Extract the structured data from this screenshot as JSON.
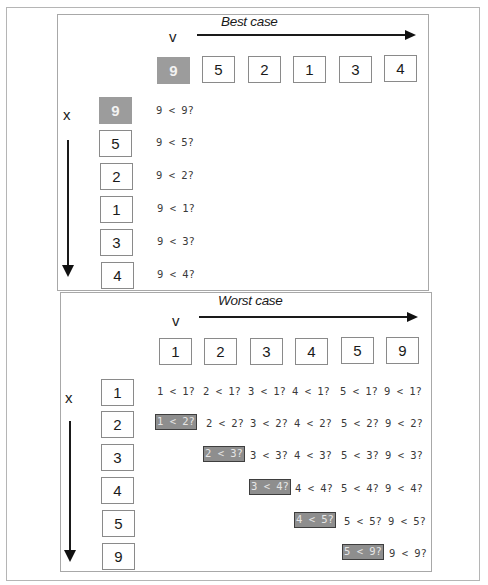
{
  "best_case": {
    "title": "Best case",
    "v_label": "v",
    "x_label": "x",
    "columns": [
      "9",
      "5",
      "2",
      "1",
      "3",
      "4"
    ],
    "highlight_column": 0,
    "rows": [
      {
        "value": "9",
        "highlight": true,
        "comparisons": [
          "9 < 9?"
        ]
      },
      {
        "value": "5",
        "highlight": false,
        "comparisons": [
          "9 < 5?"
        ]
      },
      {
        "value": "2",
        "highlight": false,
        "comparisons": [
          "9 < 2?"
        ]
      },
      {
        "value": "1",
        "highlight": false,
        "comparisons": [
          "9 < 1?"
        ]
      },
      {
        "value": "3",
        "highlight": false,
        "comparisons": [
          "9 < 3?"
        ]
      },
      {
        "value": "4",
        "highlight": false,
        "comparisons": [
          "9 < 4?"
        ]
      }
    ]
  },
  "worst_case": {
    "title": "Worst case",
    "v_label": "v",
    "x_label": "x",
    "columns": [
      "1",
      "2",
      "3",
      "4",
      "5",
      "9"
    ],
    "rows": [
      {
        "value": "1",
        "start_col": 0,
        "highlight_first": false,
        "comparisons": [
          "1 < 1?",
          "2 < 1?",
          "3 < 1?",
          "4 < 1?",
          "5 < 1?",
          "9 < 1?"
        ]
      },
      {
        "value": "2",
        "start_col": 0,
        "highlight_first": true,
        "comparisons": [
          "1 < 2?",
          "2 < 2?",
          "3 < 2?",
          "4 < 2?",
          "5 < 2?",
          "9 < 2?"
        ]
      },
      {
        "value": "3",
        "start_col": 1,
        "highlight_first": true,
        "comparisons": [
          "2 < 3?",
          "3 < 3?",
          "4 < 3?",
          "5 < 3?",
          "9 < 3?"
        ]
      },
      {
        "value": "4",
        "start_col": 2,
        "highlight_first": true,
        "comparisons": [
          "3 < 4?",
          "4 < 4?",
          "5 < 4?",
          "9 < 4?"
        ]
      },
      {
        "value": "5",
        "start_col": 3,
        "highlight_first": true,
        "comparisons": [
          "4 < 5?",
          "5 < 5?",
          "9 < 5?"
        ]
      },
      {
        "value": "9",
        "start_col": 4,
        "highlight_first": true,
        "comparisons": [
          "5 < 9?",
          "9 < 9?"
        ]
      }
    ]
  },
  "colors": {
    "highlight_fill": "#9c9c9c",
    "highlight_compare_fill": "#8e8e8e",
    "highlight_compare_border": "#3e3e3e",
    "border": "#8a8a8a"
  }
}
